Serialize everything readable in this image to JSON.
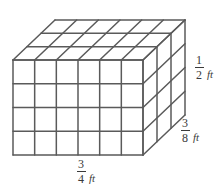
{
  "figure": {
    "shape": "rectangular prism divided into unit cubes",
    "grid": {
      "columns": 6,
      "rows": 4,
      "depth_layers": 3
    },
    "colors": {
      "stroke": "#5a5a5a",
      "background": "#ffffff",
      "text": "#3a3a3a"
    },
    "labels": {
      "width": {
        "name": "width-dimension",
        "numerator": "3",
        "denominator": "4",
        "unit": "ft"
      },
      "depth": {
        "name": "depth-dimension",
        "numerator": "3",
        "denominator": "8",
        "unit": "ft"
      },
      "height": {
        "name": "height-dimension",
        "numerator": "1",
        "denominator": "2",
        "unit": "ft"
      }
    }
  }
}
